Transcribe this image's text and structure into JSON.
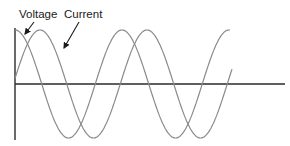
{
  "diagram": {
    "title": "",
    "labels": {
      "voltage": "Voltage",
      "current": "Current"
    },
    "series": [
      {
        "name": "Voltage",
        "phase": "leading",
        "color": "#8a8a8a"
      },
      {
        "name": "Current",
        "phase": "lagging",
        "color": "#8a8a8a"
      }
    ],
    "axis_color": "#2a2a2a",
    "text_color": "#1a1a1a"
  }
}
